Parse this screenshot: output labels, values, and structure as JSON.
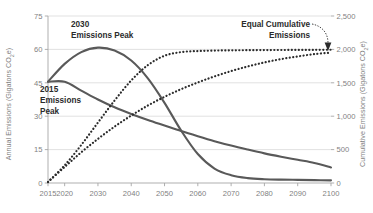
{
  "chart_data": {
    "type": "line",
    "title": "",
    "xlabel": "",
    "ylabel": "Annual Emissions (Gigatons CO2e)",
    "y2label": "Cumulative Emissions (Gigatons CO2e)",
    "xlim": [
      2015,
      2100
    ],
    "ylim": [
      0,
      75
    ],
    "y2lim": [
      0,
      2500
    ],
    "grid": true,
    "legend_position": "none",
    "x_ticks": [
      "2015",
      "2020",
      "2030",
      "2040",
      "2050",
      "2060",
      "2070",
      "2080",
      "2090",
      "2100"
    ],
    "x_tick_values": [
      2015,
      2020,
      2030,
      2040,
      2050,
      2060,
      2070,
      2080,
      2090,
      2100
    ],
    "y_ticks": [
      "0",
      "15",
      "30",
      "45",
      "60",
      "75"
    ],
    "y_tick_values": [
      0,
      15,
      30,
      45,
      60,
      75
    ],
    "y2_ticks": [
      "0",
      "500",
      "1,000",
      "1,500",
      "2,000",
      "2,500"
    ],
    "y2_tick_values": [
      0,
      500,
      1000,
      1500,
      2000,
      2500
    ],
    "x": [
      2015,
      2020,
      2025,
      2030,
      2035,
      2040,
      2045,
      2050,
      2055,
      2060,
      2065,
      2070,
      2075,
      2080,
      2085,
      2090,
      2095,
      2100
    ],
    "series": [
      {
        "name": "2015 Emissions Peak — annual emissions",
        "style": "solid",
        "axis": "left",
        "color": "#595959",
        "values": [
          45.5,
          45.5,
          41.5,
          37.5,
          34.0,
          31.0,
          28.3,
          25.8,
          23.3,
          21.0,
          18.8,
          16.8,
          15.0,
          13.3,
          11.8,
          10.4,
          9.0,
          7.0
        ]
      },
      {
        "name": "2030 Emissions Peak — annual emissions",
        "style": "solid",
        "axis": "left",
        "color": "#595959",
        "values": [
          45.5,
          53.5,
          58.8,
          60.8,
          59.5,
          55.0,
          47.0,
          36.0,
          23.5,
          13.0,
          6.5,
          3.5,
          2.2,
          1.7,
          1.5,
          1.4,
          1.3,
          1.2
        ]
      },
      {
        "name": "2015 Emissions Peak — cumulative emissions",
        "style": "dotted",
        "axis": "right",
        "color": "#2b2b2b",
        "values": [
          15,
          240,
          460,
          660,
          845,
          1010,
          1160,
          1290,
          1405,
          1505,
          1595,
          1675,
          1745,
          1805,
          1855,
          1895,
          1930,
          1950
        ]
      },
      {
        "name": "2030 Emissions Peak — cumulative emissions",
        "style": "dotted",
        "axis": "right",
        "color": "#2b2b2b",
        "values": [
          15,
          265,
          570,
          905,
          1235,
          1535,
          1765,
          1905,
          1960,
          1975,
          1982,
          1986,
          1988,
          1990,
          1991,
          1992,
          1993,
          1995
        ]
      }
    ],
    "annotations": [
      {
        "id": "peak-2030",
        "text_lines": [
          "2030",
          "Emissions Peak"
        ],
        "x": 2030,
        "y": 68
      },
      {
        "id": "peak-2015",
        "text_lines": [
          "2015",
          "Emissions",
          "Peak"
        ],
        "x": 2019,
        "y": 42
      },
      {
        "id": "equal-cumulative",
        "text_lines": [
          "Equal Cumulative",
          "Emissions"
        ],
        "x": 2083,
        "y": 70,
        "arrow_to_x": 2099,
        "arrow_to_y2": 2020
      }
    ]
  },
  "colors": {
    "line": "#595959",
    "dotted": "#2b2b2b",
    "grid": "#d9d9d9",
    "axis": "#a6a6a6",
    "tick_text": "#7f7f7f",
    "annotation_text": "#2b2b2b",
    "background": "#ffffff"
  }
}
